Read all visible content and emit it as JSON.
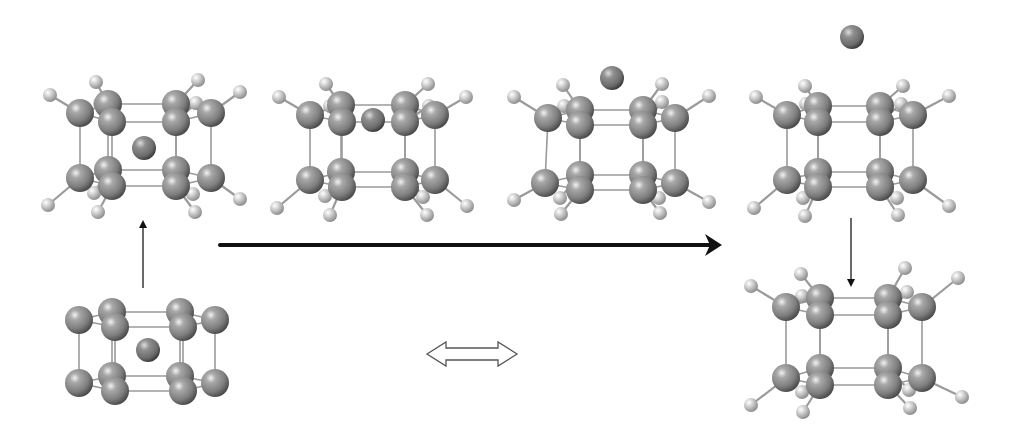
{
  "figure": {
    "width": 1013,
    "height": 436,
    "background": "#ffffff",
    "colors": {
      "carbon": "#8a8a8a",
      "carbon_highlight": "#e6e6e6",
      "carbon_shadow": "#4a4a4a",
      "hydrogen": "#c9c9c9",
      "hydrogen_highlight": "#ffffff",
      "hydrogen_shadow": "#8f8f8f",
      "ion": "#7a7a7a",
      "bond": "#9a9a9a",
      "arrow": "#111111",
      "thin_arrow": "#444444",
      "open_arrow_stroke": "#555555"
    }
  },
  "structures": [
    {
      "id": "s1-ion-inside",
      "label": "ion inside cage (with H)",
      "carbons": [
        [
          80,
          113
        ],
        [
          108,
          104
        ],
        [
          112,
          122
        ],
        [
          176,
          104
        ],
        [
          176,
          122
        ],
        [
          211,
          113
        ],
        [
          80,
          178
        ],
        [
          108,
          170
        ],
        [
          112,
          186
        ],
        [
          176,
          170
        ],
        [
          176,
          186
        ],
        [
          211,
          178
        ]
      ],
      "hydrogens": [
        [
          50,
          95
        ],
        [
          96,
          82
        ],
        [
          100,
          103
        ],
        [
          198,
          80
        ],
        [
          196,
          103
        ],
        [
          240,
          92
        ],
        [
          48,
          205
        ],
        [
          98,
          212
        ],
        [
          94,
          193
        ],
        [
          195,
          212
        ],
        [
          193,
          194
        ],
        [
          240,
          199
        ]
      ],
      "ion": [
        144,
        148
      ],
      "h_bonds": [
        [
          0,
          0
        ],
        [
          1,
          1
        ],
        [
          2,
          2
        ],
        [
          3,
          3
        ],
        [
          4,
          4
        ],
        [
          5,
          5
        ],
        [
          6,
          6
        ],
        [
          8,
          7
        ],
        [
          7,
          8
        ],
        [
          10,
          9
        ],
        [
          9,
          10
        ],
        [
          11,
          11
        ]
      ]
    },
    {
      "id": "s2-ion-in-face",
      "label": "ion in cage face",
      "carbons": [
        [
          310,
          115
        ],
        [
          341,
          105
        ],
        [
          342,
          122
        ],
        [
          405,
          105
        ],
        [
          405,
          122
        ],
        [
          435,
          115
        ],
        [
          310,
          180
        ],
        [
          341,
          172
        ],
        [
          342,
          187
        ],
        [
          405,
          172
        ],
        [
          405,
          187
        ],
        [
          435,
          180
        ]
      ],
      "hydrogens": [
        [
          279,
          97
        ],
        [
          326,
          84
        ],
        [
          330,
          106
        ],
        [
          428,
          84
        ],
        [
          429,
          106
        ],
        [
          466,
          97
        ],
        [
          277,
          208
        ],
        [
          330,
          215
        ],
        [
          325,
          196
        ],
        [
          427,
          215
        ],
        [
          423,
          197
        ],
        [
          467,
          206
        ]
      ],
      "ion": [
        373,
        120
      ],
      "h_bonds": [
        [
          0,
          0
        ],
        [
          1,
          1
        ],
        [
          2,
          2
        ],
        [
          3,
          3
        ],
        [
          4,
          4
        ],
        [
          5,
          5
        ],
        [
          6,
          6
        ],
        [
          8,
          7
        ],
        [
          7,
          8
        ],
        [
          10,
          9
        ],
        [
          9,
          10
        ],
        [
          11,
          11
        ]
      ]
    },
    {
      "id": "s3-ion-above",
      "label": "ion leaving cage",
      "carbons": [
        [
          548,
          118
        ],
        [
          580,
          110
        ],
        [
          580,
          125
        ],
        [
          643,
          110
        ],
        [
          643,
          125
        ],
        [
          675,
          118
        ],
        [
          545,
          183
        ],
        [
          580,
          175
        ],
        [
          580,
          190
        ],
        [
          643,
          175
        ],
        [
          643,
          190
        ],
        [
          675,
          183
        ]
      ],
      "hydrogens": [
        [
          514,
          97
        ],
        [
          563,
          85
        ],
        [
          564,
          106
        ],
        [
          662,
          84
        ],
        [
          662,
          102
        ],
        [
          709,
          96
        ],
        [
          514,
          200
        ],
        [
          561,
          214
        ],
        [
          560,
          198
        ],
        [
          660,
          213
        ],
        [
          659,
          198
        ],
        [
          709,
          202
        ]
      ],
      "ion": [
        612,
        78
      ],
      "h_bonds": [
        [
          0,
          0
        ],
        [
          1,
          1
        ],
        [
          2,
          2
        ],
        [
          3,
          3
        ],
        [
          4,
          4
        ],
        [
          5,
          5
        ],
        [
          6,
          6
        ],
        [
          8,
          7
        ],
        [
          7,
          8
        ],
        [
          10,
          9
        ],
        [
          9,
          10
        ],
        [
          11,
          11
        ]
      ]
    },
    {
      "id": "s4-ion-outside",
      "label": "ion far outside cage",
      "carbons": [
        [
          787,
          115
        ],
        [
          818,
          106
        ],
        [
          818,
          122
        ],
        [
          880,
          106
        ],
        [
          880,
          122
        ],
        [
          913,
          115
        ],
        [
          787,
          180
        ],
        [
          818,
          172
        ],
        [
          818,
          187
        ],
        [
          880,
          172
        ],
        [
          880,
          187
        ],
        [
          913,
          180
        ]
      ],
      "hydrogens": [
        [
          756,
          97
        ],
        [
          805,
          86
        ],
        [
          806,
          104
        ],
        [
          903,
          86
        ],
        [
          901,
          104
        ],
        [
          949,
          96
        ],
        [
          754,
          208
        ],
        [
          805,
          216
        ],
        [
          803,
          198
        ],
        [
          898,
          215
        ],
        [
          897,
          198
        ],
        [
          949,
          206
        ]
      ],
      "ion": [
        852,
        37
      ],
      "h_bonds": [
        [
          0,
          0
        ],
        [
          1,
          1
        ],
        [
          2,
          2
        ],
        [
          3,
          3
        ],
        [
          4,
          4
        ],
        [
          5,
          5
        ],
        [
          6,
          6
        ],
        [
          8,
          7
        ],
        [
          7,
          8
        ],
        [
          10,
          9
        ],
        [
          9,
          10
        ],
        [
          11,
          11
        ]
      ]
    },
    {
      "id": "s5-empty-cage",
      "label": "empty cage (with H)",
      "carbons": [
        [
          786,
          307
        ],
        [
          820,
          298
        ],
        [
          820,
          315
        ],
        [
          888,
          298
        ],
        [
          888,
          315
        ],
        [
          922,
          307
        ],
        [
          786,
          378
        ],
        [
          820,
          368
        ],
        [
          820,
          385
        ],
        [
          888,
          368
        ],
        [
          888,
          385
        ],
        [
          922,
          378
        ]
      ],
      "hydrogens": [
        [
          751,
          286
        ],
        [
          801,
          274
        ],
        [
          802,
          296
        ],
        [
          905,
          268
        ],
        [
          907,
          292
        ],
        [
          958,
          278
        ],
        [
          751,
          405
        ],
        [
          803,
          412
        ],
        [
          802,
          392
        ],
        [
          910,
          408
        ],
        [
          909,
          390
        ],
        [
          962,
          397
        ]
      ],
      "ion": null,
      "h_bonds": [
        [
          0,
          0
        ],
        [
          1,
          1
        ],
        [
          2,
          2
        ],
        [
          3,
          3
        ],
        [
          4,
          4
        ],
        [
          5,
          5
        ],
        [
          6,
          6
        ],
        [
          8,
          7
        ],
        [
          7,
          8
        ],
        [
          10,
          9
        ],
        [
          9,
          10
        ],
        [
          11,
          11
        ]
      ]
    },
    {
      "id": "s6-ion-inside-bare",
      "label": "ion inside cage (no H)",
      "carbons": [
        [
          79,
          320
        ],
        [
          112,
          312
        ],
        [
          115,
          327
        ],
        [
          180,
          312
        ],
        [
          183,
          327
        ],
        [
          215,
          320
        ],
        [
          79,
          383
        ],
        [
          112,
          376
        ],
        [
          115,
          391
        ],
        [
          180,
          376
        ],
        [
          183,
          391
        ],
        [
          215,
          383
        ]
      ],
      "hydrogens": [],
      "ion": [
        148,
        350
      ],
      "h_bonds": []
    }
  ],
  "cage_bonds": [
    [
      0,
      1
    ],
    [
      0,
      2
    ],
    [
      1,
      3
    ],
    [
      2,
      4
    ],
    [
      3,
      5
    ],
    [
      4,
      5
    ],
    [
      6,
      7
    ],
    [
      6,
      8
    ],
    [
      7,
      9
    ],
    [
      8,
      10
    ],
    [
      9,
      11
    ],
    [
      10,
      11
    ],
    [
      0,
      6
    ],
    [
      1,
      7
    ],
    [
      2,
      8
    ],
    [
      3,
      9
    ],
    [
      4,
      10
    ],
    [
      5,
      11
    ]
  ],
  "arrows": {
    "main": {
      "x1": 220,
      "y1": 245,
      "x2": 722,
      "y2": 245,
      "width": 4,
      "label": "pathway-arrow"
    },
    "up": {
      "x1": 143,
      "y1": 288,
      "x2": 143,
      "y2": 220,
      "width": 1.6,
      "label": "up-arrow"
    },
    "down": {
      "x1": 851,
      "y1": 218,
      "x2": 851,
      "y2": 287,
      "width": 1.6,
      "label": "down-arrow"
    },
    "equilibrium": {
      "x1": 427,
      "x2": 517,
      "y": 354,
      "shaft_half": 6,
      "head_half": 12,
      "head_len": 19
    }
  }
}
